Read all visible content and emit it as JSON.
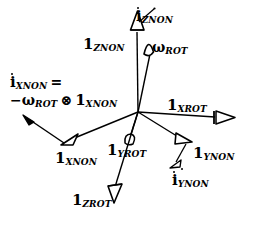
{
  "figure": {
    "background": "#ffffff",
    "ink": "#000000",
    "width": 253,
    "height": 225,
    "origin": {
      "x": 138,
      "y": 112
    }
  },
  "labels": {
    "i_dot_znon": {
      "base": "i",
      "sub": "ZNON",
      "dotted": true,
      "x": 136,
      "y": 8
    },
    "one_znon": {
      "base": "1",
      "sub": "ZNON",
      "dotted": false,
      "x": 83,
      "y": 36
    },
    "omega_rot": {
      "base": "ω",
      "sub": "ROT",
      "dotted": false,
      "x": 152,
      "y": 39
    },
    "one_xrot": {
      "base": "1",
      "sub": "XROT",
      "dotted": false,
      "x": 167,
      "y": 97
    },
    "one_xnon": {
      "base": "1",
      "sub": "XNON",
      "dotted": false,
      "x": 55,
      "y": 150
    },
    "one_yrot": {
      "base": "1",
      "sub": "YROT",
      "dotted": false,
      "x": 108,
      "y": 142
    },
    "one_ynon": {
      "base": "1",
      "sub": "YNON",
      "dotted": false,
      "x": 196,
      "y": 145
    },
    "i_dot_ynon": {
      "base": "i",
      "sub": "YNON",
      "dotted": true,
      "x": 172,
      "y": 170
    },
    "one_zrot": {
      "base": "1",
      "sub": "ZROT",
      "dotted": false,
      "x": 73,
      "y": 192
    }
  },
  "equation": {
    "x": 10,
    "y": 74,
    "line1": {
      "base": "i",
      "sub": "XNON",
      "dotted": true,
      "equals": "="
    },
    "line2": {
      "minus": "−",
      "omega": "ω",
      "omega_sub": "ROT",
      "operator": "⊗",
      "unit": "1",
      "unit_sub": "XNON"
    }
  },
  "vectors": [
    {
      "name": "1-znon-axis",
      "label": "1_ZNON",
      "x1": 138,
      "y1": 112,
      "x2": 137,
      "y2": 28,
      "head": "open-up"
    },
    {
      "name": "i-dot-znon",
      "label": "i_ZNON",
      "x1": 137,
      "y1": 28,
      "x2": 151,
      "y2": 14,
      "head": "thin"
    },
    {
      "name": "omega-rot",
      "label": "omega_ROT",
      "x1": 138,
      "y1": 112,
      "x2": 150,
      "y2": 46,
      "head": "open"
    },
    {
      "name": "1-xrot-axis",
      "label": "1_XROT",
      "x1": 138,
      "y1": 112,
      "x2": 220,
      "y2": 117,
      "head": "open-right"
    },
    {
      "name": "1-xnon-axis",
      "label": "1_XNON",
      "x1": 138,
      "y1": 112,
      "x2": 66,
      "y2": 142,
      "head": "open"
    },
    {
      "name": "i-dot-xnon",
      "label": "i_XNON",
      "x1": 66,
      "y1": 142,
      "x2": 27,
      "y2": 118,
      "head": "solid"
    },
    {
      "name": "1-yrot-axis",
      "label": "1_YROT",
      "x1": 138,
      "y1": 112,
      "x2": 128,
      "y2": 140,
      "head": "open-small"
    },
    {
      "name": "1-ynon-axis",
      "label": "1_YNON",
      "x1": 138,
      "y1": 112,
      "x2": 186,
      "y2": 141,
      "head": "open"
    },
    {
      "name": "i-dot-ynon",
      "label": "i_YNON",
      "x1": 186,
      "y1": 141,
      "x2": 172,
      "y2": 165,
      "head": "small-open"
    },
    {
      "name": "1-zrot-axis",
      "label": "1_ZROT",
      "x1": 138,
      "y1": 112,
      "x2": 112,
      "y2": 196,
      "head": "open-down"
    }
  ]
}
